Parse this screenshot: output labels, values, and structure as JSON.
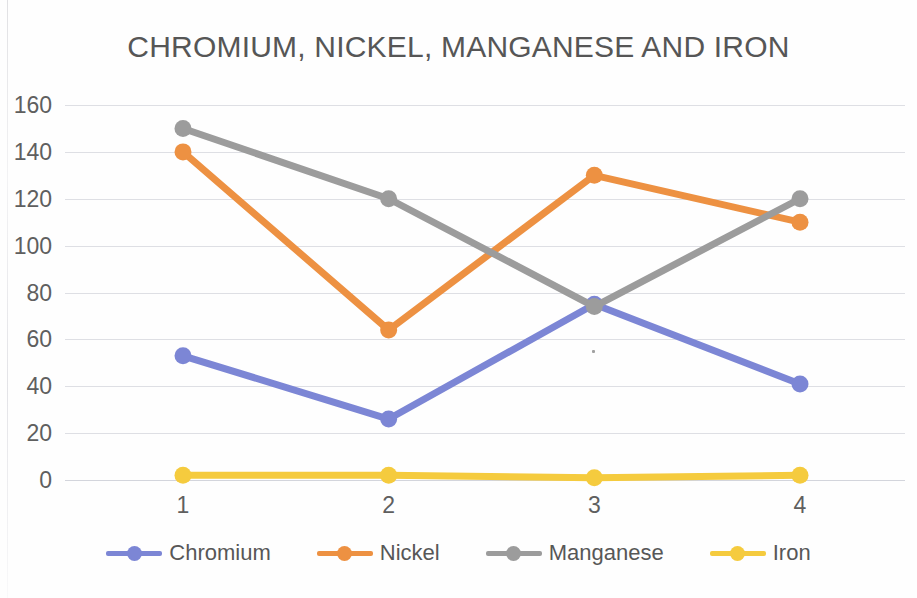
{
  "chart_data": {
    "type": "line",
    "title": "CHROMIUM, NICKEL, MANGANESE AND IRON",
    "xlabel": "",
    "ylabel": "",
    "categories": [
      "1",
      "2",
      "3",
      "4"
    ],
    "ylim": [
      0,
      160
    ],
    "ytick_step": 20,
    "yticks": [
      "160",
      "140",
      "120",
      "100",
      "80",
      "60",
      "40",
      "20",
      "0"
    ],
    "grid": true,
    "legend_position": "bottom",
    "series": [
      {
        "name": "Chromium",
        "color": "#7C86D5",
        "values": [
          53,
          26,
          75,
          41
        ]
      },
      {
        "name": "Nickel",
        "color": "#ED9142",
        "values": [
          140,
          64,
          130,
          110
        ]
      },
      {
        "name": "Manganese",
        "color": "#9C9C9C",
        "values": [
          150,
          120,
          74,
          120
        ]
      },
      {
        "name": "Iron",
        "color": "#F5CB3E",
        "values": [
          2,
          2,
          1,
          2
        ]
      }
    ]
  },
  "colors": {
    "background": "#fefefe",
    "text": "#575757",
    "title_text": "#565656",
    "gridline": "#afb2be"
  }
}
